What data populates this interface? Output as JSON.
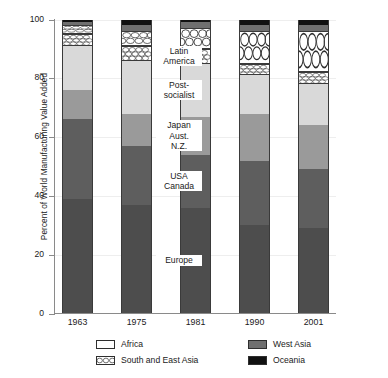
{
  "chart_data": {
    "type": "bar",
    "stacked": true,
    "title": "",
    "xlabel": "",
    "ylabel": "Percent of World Manufacturing Value Added",
    "ylim": [
      0,
      100
    ],
    "yticks": [
      0,
      20,
      40,
      60,
      80,
      100
    ],
    "grid": true,
    "legend_position": "bottom",
    "categories": [
      "1963",
      "1975",
      "1981",
      "1990",
      "2001"
    ],
    "series": [
      {
        "name": "Europe",
        "values": [
          39,
          37,
          36,
          30,
          29
        ]
      },
      {
        "name": "USA Canada",
        "values": [
          27,
          20,
          18,
          22,
          20
        ]
      },
      {
        "name": "Japan Aust. N.Z.",
        "values": [
          10,
          11,
          13,
          16,
          15
        ]
      },
      {
        "name": "Post-socialist",
        "values": [
          15,
          18,
          18,
          13,
          14
        ]
      },
      {
        "name": "Latin America",
        "values": [
          4,
          5,
          5,
          4,
          4
        ]
      },
      {
        "name": "South and East Asia",
        "values": [
          3,
          5,
          7,
          11,
          14
        ]
      },
      {
        "name": "West Asia",
        "values": [
          1,
          2,
          2,
          2,
          2
        ]
      },
      {
        "name": "Oceania",
        "values": [
          1,
          2,
          1,
          2,
          2
        ]
      }
    ],
    "annotations": [
      {
        "text": "Latin\nAmerica",
        "series": "Latin America"
      },
      {
        "text": "Post-\nsocialist",
        "series": "Post-socialist"
      },
      {
        "text": "Japan\nAust.\nN.Z.",
        "series": "Japan Aust. N.Z."
      },
      {
        "text": "USA\nCanada",
        "series": "USA Canada"
      },
      {
        "text": "Europe",
        "series": "Europe"
      }
    ],
    "legend_entries": [
      {
        "label": "Africa",
        "pattern": "solid",
        "color": "#ffffff"
      },
      {
        "label": "West Asia",
        "pattern": "solid",
        "color": "#6f6f6f"
      },
      {
        "label": "South and East Asia",
        "pattern": "circles",
        "color": "#ffffff"
      },
      {
        "label": "Oceania",
        "pattern": "solid",
        "color": "#111111"
      }
    ]
  },
  "axis": {
    "y_title": "Percent of World Manufacturing Value Added",
    "y_tick_labels": [
      "100",
      "80",
      "60",
      "40",
      "20",
      "0"
    ],
    "x_tick_labels": [
      "1963",
      "1975",
      "1981",
      "1990",
      "2001"
    ]
  },
  "annotations": {
    "latin_america": "Latin\nAmerica",
    "post_socialist": "Post-\nsocialist",
    "japan_aust_nz": "Japan\nAust.\nN.Z.",
    "usa_canada": "USA\nCanada",
    "europe": "Europe"
  },
  "legend": {
    "africa": "Africa",
    "west_asia": "West Asia",
    "south_and_east_asia": "South and East Asia",
    "oceania": "Oceania"
  }
}
